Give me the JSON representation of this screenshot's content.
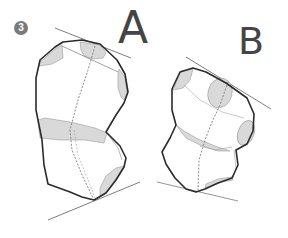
{
  "figure": {
    "step_number": "3",
    "labels": {
      "a": "A",
      "b": "B"
    },
    "colors": {
      "outline": "#2b2b2b",
      "construction_line": "#6e6e6e",
      "shade_fill": "#d9d9d9",
      "badge": "#7a7a7a",
      "label_text": "#454545"
    },
    "shapes": [
      {
        "id": "a",
        "description": "tall faceted form with top tangent line and bottom tangent line, shaded facet band"
      },
      {
        "id": "b",
        "description": "tilted faceted form with top tangent line and bottom tangent line, shaded oval facets"
      }
    ]
  }
}
